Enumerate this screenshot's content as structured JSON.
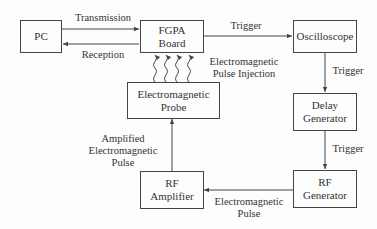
{
  "nodes": {
    "pc": {
      "label": "PC"
    },
    "fpga": {
      "line1": "FGPA",
      "line2": "Board"
    },
    "oscilloscope": {
      "label": "Oscilloscope"
    },
    "delay": {
      "line1": "Delay",
      "line2": "Generator"
    },
    "rf_generator": {
      "line1": "RF",
      "line2": "Generator"
    },
    "rf_amplifier": {
      "line1": "RF",
      "line2": "Amplifier"
    },
    "probe": {
      "line1": "Electromagnetic",
      "line2": "Probe"
    }
  },
  "edges": {
    "transmission": "Transmission",
    "reception": "Reception",
    "trigger_fpga_osc": "Trigger",
    "trigger_osc_delay": "Trigger",
    "trigger_delay_rf": "Trigger",
    "em_pulse": {
      "line1": "Electromagnetic",
      "line2": "Pulse"
    },
    "amplified": {
      "line1": "Amplified",
      "line2": "Electromagnetic",
      "line3": "Pulse"
    },
    "injection": {
      "line1": "Electromagnetic",
      "line2": "Pulse Injection"
    }
  }
}
